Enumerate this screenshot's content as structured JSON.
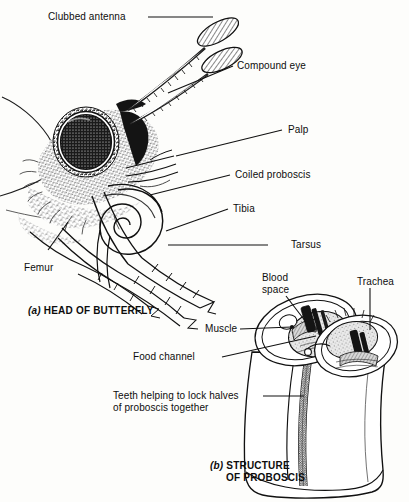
{
  "figure": {
    "title_a": "(a) HEAD OF BUTTERFLY",
    "title_b_line1": "(b) STRUCTURE",
    "title_b_line2": "OF PROBOSCIS",
    "part_a_prefix": "(a)",
    "part_a_text": " HEAD OF BUTTERFLY",
    "part_b_prefix": "(b)",
    "part_b_text": " STRUCTURE",
    "part_b_text2": "OF PROBOSCIS",
    "ink_color": "#111111",
    "paper_color": "#fdfdfb"
  },
  "labels": {
    "clubbed_antenna": "Clubbed antenna",
    "compound_eye": "Compound eye",
    "palp": "Palp",
    "coiled_proboscis": "Coiled proboscis",
    "tibia": "Tibia",
    "tarsus": "Tarsus",
    "femur": "Femur",
    "blood_space_line1": "Blood",
    "blood_space_line2": "space",
    "trachea": "Trachea",
    "muscle": "Muscle",
    "food_channel": "Food channel",
    "teeth_line1": "Teeth helping to lock halves",
    "teeth_line2": "of proboscis together"
  }
}
